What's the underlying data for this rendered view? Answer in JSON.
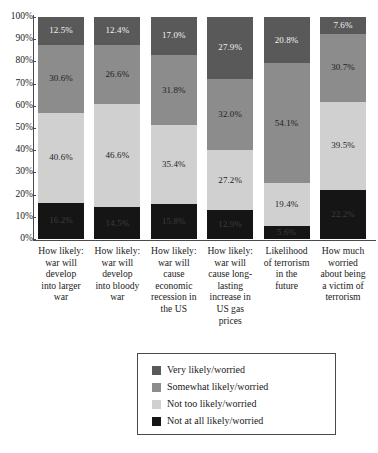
{
  "chart_data": {
    "type": "bar",
    "subtype": "100% stacked bar",
    "title": "",
    "xlabel": "",
    "ylabel": "",
    "ylim": [
      0,
      100
    ],
    "ytick_labels": [
      "100%",
      "90%",
      "80%",
      "70%",
      "60%",
      "50%",
      "40%",
      "30%",
      "20%",
      "10%",
      "0%"
    ],
    "ytick_values": [
      100,
      90,
      80,
      70,
      60,
      50,
      40,
      30,
      20,
      10,
      0
    ],
    "grid": false,
    "legend_position": "bottom",
    "stack_order_top_to_bottom": [
      "Very likely/worried",
      "Somewhat likely/worried",
      "Not too likely/worried",
      "Not at all likely/worried"
    ],
    "categories": [
      "How likely: war will develop into larger war",
      "How likely: war will develop into bloody war",
      "How likely: war will cause economic recession in the US",
      "How likely: war will cause long-lasting increase in US gas prices",
      "Likelihood of terrorism in the future",
      "How much worried about being a victim of terrorism"
    ],
    "category_lines": [
      [
        "How likely:",
        "war will",
        "develop",
        "into larger",
        "war"
      ],
      [
        "How likely:",
        "war will",
        "develop",
        "into bloody",
        "war"
      ],
      [
        "How likely:",
        "war will",
        "cause",
        "economic",
        "recession in",
        "the US"
      ],
      [
        "How likely:",
        "war will",
        "cause long-",
        "lasting",
        "increase in",
        "US gas",
        "prices"
      ],
      [
        "Likelihood",
        "of terrorism",
        "in the",
        "future"
      ],
      [
        "How much",
        "worried",
        "about being",
        "a victim of",
        "terrorism"
      ]
    ],
    "series": [
      {
        "name": "Very likely/worried",
        "color": "#595959",
        "values": [
          12.5,
          12.4,
          17.0,
          27.9,
          20.8,
          7.6
        ],
        "labels": [
          "12.5%",
          "12.4%",
          "17.0%",
          "27.9%",
          "20.8%",
          "7.6%"
        ]
      },
      {
        "name": "Somewhat likely/worried",
        "color": "#8c8c8c",
        "values": [
          30.6,
          26.6,
          31.8,
          32.0,
          54.1,
          30.7
        ],
        "labels": [
          "30.6%",
          "26.6%",
          "31.8%",
          "32.0%",
          "54.1%",
          "30.7%"
        ]
      },
      {
        "name": "Not too likely/worried",
        "color": "#d0d0d0",
        "values": [
          40.6,
          46.6,
          35.4,
          27.2,
          19.4,
          39.5
        ],
        "labels": [
          "40.6%",
          "46.6%",
          "35.4%",
          "27.2%",
          "19.4%",
          "39.5%"
        ]
      },
      {
        "name": "Not at all likely/worried",
        "color": "#151515",
        "values": [
          16.2,
          14.5,
          15.8,
          12.9,
          5.6,
          22.2
        ],
        "labels": [
          "16.2%",
          "14.5%",
          "15.8%",
          "12.9%",
          "5.6%",
          "22.2%"
        ]
      }
    ]
  },
  "legend": {
    "items": [
      {
        "label": "Very likely/worried",
        "color": "#595959"
      },
      {
        "label": "Somewhat likely/worried",
        "color": "#8c8c8c"
      },
      {
        "label": "Not too likely/worried",
        "color": "#d0d0d0"
      },
      {
        "label": "Not at all likely/worried",
        "color": "#151515"
      }
    ]
  }
}
